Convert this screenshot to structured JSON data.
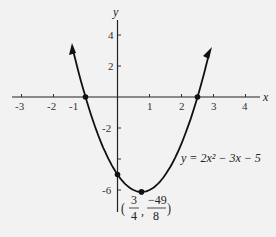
{
  "chart_data": {
    "type": "line",
    "title": "",
    "xlabel": "x",
    "ylabel": "y",
    "xlim": [
      -3.5,
      4.5
    ],
    "ylim": [
      -7,
      5
    ],
    "x_ticks": [
      "-3",
      "-2",
      "-1",
      "1",
      "2",
      "3",
      "4"
    ],
    "y_ticks": [
      "4",
      "2",
      "-2",
      "-6"
    ],
    "grid": false,
    "series": [
      {
        "name": "y = 2x^2 - 3x - 5",
        "function": "2x^2 - 3x - 5",
        "x_range": [
          -1.4,
          2.87
        ]
      }
    ],
    "points": [
      {
        "x": -1,
        "y": 0,
        "label": "root"
      },
      {
        "x": 2.5,
        "y": 0,
        "label": "root"
      },
      {
        "x": 0,
        "y": -5,
        "label": "y-intercept"
      },
      {
        "x": 0.75,
        "y": -6.125,
        "label": "vertex (3/4, -49/8)"
      }
    ],
    "annotations": {
      "equation": "y = 2x² − 3x − 5",
      "vertex_num_x": "3",
      "vertex_den_x": "4",
      "vertex_num_y": "−49",
      "vertex_den_y": "8"
    }
  }
}
